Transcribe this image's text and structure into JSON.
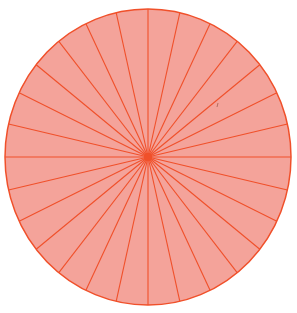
{
  "figure": {
    "type": "divided-circle",
    "sectors": 28,
    "center": [
      148,
      157
    ],
    "radius_x": 143,
    "radius_y": 148,
    "colors": {
      "fill": "#f4a39a",
      "stroke": "#f0502a",
      "background": "#ffffff"
    }
  }
}
